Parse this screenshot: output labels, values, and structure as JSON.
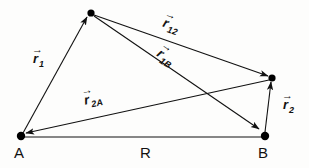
{
  "figure": {
    "background_color": "#fdfdfc",
    "stroke_color": "#111111"
  },
  "points": [
    {
      "id": "A",
      "name": "origin-point-a",
      "label": "A",
      "x": 21,
      "y": 136,
      "label_x": 14,
      "label_y": 145
    },
    {
      "id": "B",
      "name": "origin-point-b",
      "label": "B",
      "x": 265,
      "y": 136,
      "label_x": 258,
      "label_y": 145
    },
    {
      "id": "P1",
      "name": "particle-point-1",
      "label": "",
      "x": 91,
      "y": 13,
      "label_x": 0,
      "label_y": 0
    },
    {
      "id": "P2",
      "name": "particle-point-2",
      "label": "",
      "x": 272,
      "y": 78,
      "label_x": 0,
      "label_y": 0
    }
  ],
  "vectors": [
    {
      "name": "vector-r1",
      "symbol": "r",
      "subscript": "1",
      "from": "A",
      "to": "P1",
      "x1": 23,
      "y1": 133,
      "x2": 87,
      "y2": 17,
      "arrow_at_end": true,
      "label_x": 33,
      "label_y": 52,
      "rotation": 0
    },
    {
      "name": "vector-r12",
      "symbol": "r",
      "subscript": "12",
      "from": "P1",
      "to": "P2",
      "x1": 94,
      "y1": 15,
      "x2": 268,
      "y2": 76,
      "arrow_at_end": true,
      "label_x": 163,
      "label_y": 18,
      "rotation": 19
    },
    {
      "name": "vector-r1B",
      "symbol": "r",
      "subscript": "1B",
      "from": "P1",
      "to": "B",
      "x1": 94,
      "y1": 16,
      "x2": 259,
      "y2": 129,
      "arrow_at_end": true,
      "label_x": 157,
      "label_y": 50,
      "rotation": 34
    },
    {
      "name": "vector-r2A",
      "symbol": "r",
      "subscript": "2A",
      "from": "P2",
      "to": "A",
      "x1": 269,
      "y1": 80,
      "x2": 26,
      "y2": 133,
      "arrow_at_end": true,
      "label_x": 84,
      "label_y": 92,
      "rotation": -12
    },
    {
      "name": "vector-r2",
      "symbol": "r",
      "subscript": "2",
      "from": "B",
      "to": "P2",
      "x1": 265,
      "y1": 132,
      "x2": 271,
      "y2": 82,
      "arrow_at_end": true,
      "label_x": 283,
      "label_y": 98,
      "rotation": 0
    }
  ],
  "baseline": {
    "name": "separation-baseline",
    "label": "R",
    "from": "A",
    "to": "B",
    "x1": 22,
    "y1": 137,
    "x2": 264,
    "y2": 137,
    "label_x": 140,
    "label_y": 145
  }
}
